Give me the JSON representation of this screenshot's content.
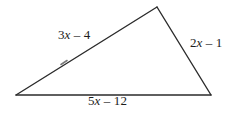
{
  "figure": {
    "kind": "triangle-diagram",
    "background_color": "#ffffff",
    "stroke_color": "#2b2b2b",
    "stroke_width": 1.4,
    "width": 230,
    "height": 117,
    "vertices": {
      "left": {
        "x": 16,
        "y": 95
      },
      "apex": {
        "x": 157,
        "y": 7
      },
      "right": {
        "x": 211,
        "y": 95
      }
    },
    "tick_mark": {
      "x": 64,
      "y": 62,
      "present": true
    }
  },
  "labels": {
    "left_side": {
      "coefficient": "3",
      "variable": "x",
      "operator": " – ",
      "constant": "4",
      "full_text": "3x – 4"
    },
    "right_side": {
      "coefficient": "2",
      "variable": "x",
      "operator": " – ",
      "constant": "1",
      "full_text": "2x – 1"
    },
    "base_side": {
      "coefficient": "5",
      "variable": "x",
      "operator": " – ",
      "constant": "12",
      "full_text": "5x – 12"
    }
  }
}
